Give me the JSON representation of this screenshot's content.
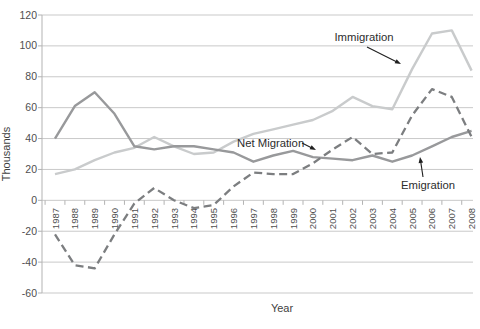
{
  "chart_data": {
    "type": "line",
    "title": "",
    "xlabel": "Year",
    "ylabel": "Thousands",
    "ylim": [
      -60,
      120
    ],
    "yticks": [
      120,
      100,
      80,
      60,
      40,
      20,
      0,
      -20,
      -40,
      -60
    ],
    "grid": "horizontal",
    "legend": "none - series labeled by arrow annotations on plot",
    "x": [
      1987,
      1988,
      1989,
      1990,
      1991,
      1992,
      1993,
      1994,
      1995,
      1996,
      1997,
      1998,
      1999,
      2000,
      2001,
      2002,
      2003,
      2004,
      2005,
      2006,
      2007,
      2008
    ],
    "series": [
      {
        "name": "Immigration",
        "style": "solid",
        "color": "#c9cbcc",
        "values": [
          17,
          20,
          26,
          31,
          34,
          41,
          35,
          30,
          31,
          38,
          43,
          46,
          49,
          52,
          58,
          67,
          61,
          59,
          85,
          108,
          110,
          84
        ]
      },
      {
        "name": "Emigration",
        "style": "solid",
        "color": "#98999b",
        "values": [
          40,
          61,
          70,
          56,
          35,
          33,
          35,
          35,
          33,
          31,
          25,
          29,
          32,
          28,
          27,
          26,
          29,
          25,
          29,
          35,
          41,
          45
        ]
      },
      {
        "name": "Net Migration",
        "style": "dashed",
        "color": "#7c7e80",
        "values": [
          -22,
          -42,
          -44,
          -22,
          -2,
          8,
          0,
          -5,
          -3,
          9,
          18,
          17,
          17,
          24,
          33,
          41,
          30,
          31,
          55,
          72,
          67,
          41
        ]
      }
    ],
    "annotations": [
      {
        "label": "Immigration",
        "anchor": "middle",
        "text_px": [
          364,
          41
        ],
        "arrow_px": [
          367,
          47,
          401,
          64
        ]
      },
      {
        "label": "Net Migration",
        "anchor": "start",
        "text_px": [
          237,
          147
        ],
        "arrow_px": [
          302,
          143,
          316,
          150
        ]
      },
      {
        "label": "Emigration",
        "anchor": "start",
        "text_px": [
          401,
          189
        ],
        "arrow_px": [
          423,
          177,
          420,
          157
        ]
      }
    ],
    "axis_color": "#b3b3b3",
    "grid_color": "#c9c9c9",
    "tick_label_color": "#4f4f4f",
    "annotation_color": "#2d2d2d",
    "arrow_color": "#1f1f1f"
  }
}
